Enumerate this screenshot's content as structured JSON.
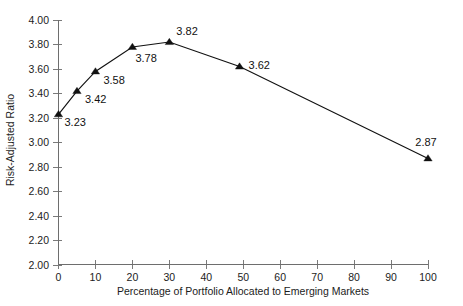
{
  "chart_data": {
    "type": "line",
    "title": "",
    "subtitle": "",
    "xlabel": "Percentage of Portfolio Allocated to Emerging Markets",
    "ylabel": "Risk-Adjusted Ratio",
    "xlim": [
      0,
      100
    ],
    "ylim": [
      2.0,
      4.0
    ],
    "xticks": [
      0,
      10,
      20,
      30,
      40,
      50,
      60,
      70,
      80,
      90,
      100
    ],
    "xtick_labels": [
      "0",
      "10",
      "20",
      "30",
      "40",
      "50",
      "60",
      "70",
      "80",
      "90",
      "100"
    ],
    "yticks": [
      2.0,
      2.2,
      2.4,
      2.6,
      2.8,
      3.0,
      3.2,
      3.4,
      3.6,
      3.8,
      4.0
    ],
    "ytick_labels": [
      "2.00",
      "2.20",
      "2.40",
      "2.60",
      "2.80",
      "3.00",
      "3.20",
      "3.40",
      "3.60",
      "3.80",
      "4.00"
    ],
    "grid": false,
    "legend": null,
    "marker": "triangle-up",
    "line_color": "#111111",
    "marker_color": "#111111",
    "axis_color": "#6e6e6e",
    "background": "#ffffff",
    "x": [
      0,
      5,
      10,
      20,
      30,
      49,
      100
    ],
    "values": [
      3.23,
      3.42,
      3.58,
      3.78,
      3.82,
      3.62,
      2.87
    ],
    "series": [
      {
        "name": "Risk-Adjusted Ratio",
        "x": [
          0,
          5,
          10,
          20,
          30,
          49,
          100
        ],
        "values": [
          3.23,
          3.42,
          3.58,
          3.78,
          3.82,
          3.62,
          2.87
        ]
      }
    ],
    "point_labels": [
      {
        "text": "3.23",
        "x": 0,
        "y": 3.23,
        "dx": 6,
        "dy": 12,
        "anchor": "start"
      },
      {
        "text": "3.42",
        "x": 5,
        "y": 3.42,
        "dx": 8,
        "dy": 12,
        "anchor": "start"
      },
      {
        "text": "3.58",
        "x": 10,
        "y": 3.58,
        "dx": 8,
        "dy": 13,
        "anchor": "start"
      },
      {
        "text": "3.78",
        "x": 20,
        "y": 3.78,
        "dx": 3,
        "dy": 15,
        "anchor": "start"
      },
      {
        "text": "3.82",
        "x": 30,
        "y": 3.82,
        "dx": 7,
        "dy": -7,
        "anchor": "start"
      },
      {
        "text": "3.62",
        "x": 49,
        "y": 3.62,
        "dx": 9,
        "dy": 2,
        "anchor": "start"
      },
      {
        "text": "2.87",
        "x": 100,
        "y": 2.87,
        "dx": -2,
        "dy": -12,
        "anchor": "middle"
      }
    ]
  }
}
